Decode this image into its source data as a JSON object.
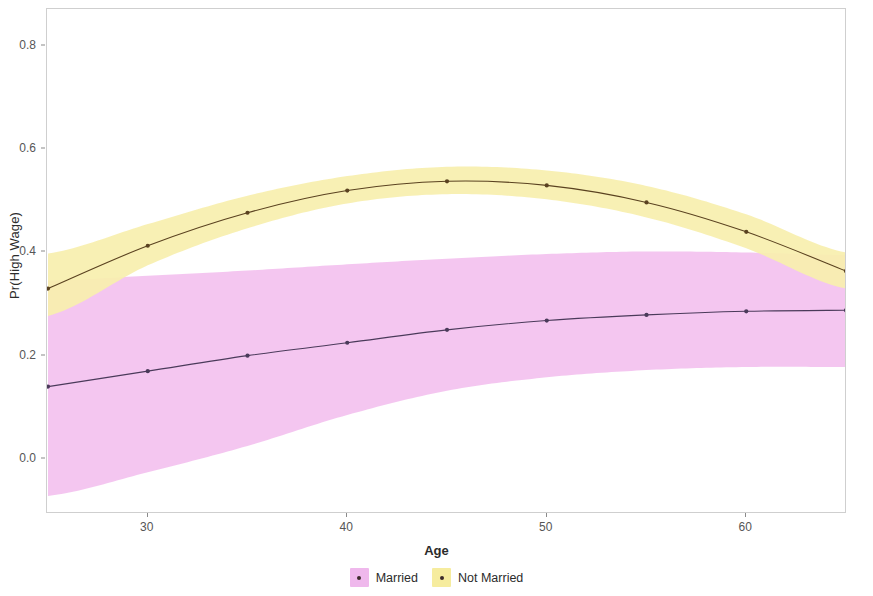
{
  "chart_data": {
    "type": "line",
    "title": "",
    "subtitle": "",
    "xlabel": "Age",
    "ylabel": "Pr(High Wage)",
    "x": [
      25,
      30,
      35,
      40,
      45,
      50,
      55,
      60,
      65
    ],
    "xlim": [
      25,
      65
    ],
    "ylim": [
      -0.105,
      0.87
    ],
    "grid": false,
    "legend_position": "bottom",
    "xticks": [
      30,
      40,
      50,
      60
    ],
    "xtick_labels": [
      "30",
      "40",
      "50",
      "60"
    ],
    "yticks": [
      0.0,
      0.2,
      0.4,
      0.6,
      0.8
    ],
    "ytick_labels": [
      "0.0",
      "0.2",
      "0.4",
      "0.6",
      "0.8"
    ],
    "series": [
      {
        "name": "Married",
        "color": "#EFB8EC",
        "line_color": "#4A3A5A",
        "band_color": "#F3C2EF",
        "values": [
          0.14,
          0.17,
          0.2,
          0.225,
          0.25,
          0.268,
          0.279,
          0.286,
          0.288
        ],
        "ci_lower": [
          -0.072,
          -0.026,
          0.025,
          0.085,
          0.132,
          0.158,
          0.172,
          0.178,
          0.178
        ],
        "ci_upper": [
          0.345,
          0.355,
          0.365,
          0.377,
          0.388,
          0.397,
          0.402,
          0.4,
          0.395
        ]
      },
      {
        "name": "Not Married",
        "color": "#F6EC9E",
        "line_color": "#5A4220",
        "band_color": "#F7EFAE",
        "values": [
          0.33,
          0.413,
          0.477,
          0.52,
          0.538,
          0.53,
          0.497,
          0.44,
          0.364
        ],
        "ci_lower": [
          0.277,
          0.375,
          0.447,
          0.495,
          0.513,
          0.503,
          0.468,
          0.408,
          0.33
        ],
        "ci_upper": [
          0.398,
          0.455,
          0.51,
          0.548,
          0.566,
          0.559,
          0.529,
          0.474,
          0.4
        ]
      }
    ]
  },
  "axes": {
    "ylabel": "Pr(High Wage)",
    "xlabel": "Age"
  },
  "legend": {
    "items": [
      {
        "label": "Married",
        "swatch": "#EFB8EC"
      },
      {
        "label": "Not Married",
        "swatch": "#F6EC9E"
      }
    ]
  }
}
